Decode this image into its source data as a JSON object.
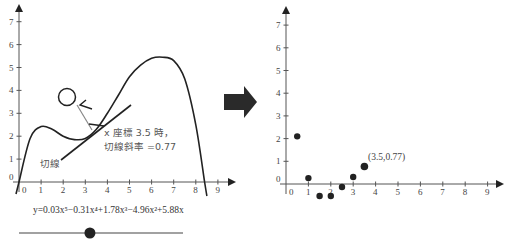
{
  "left_panel": {
    "x_ticks": [
      "0",
      "1",
      "2",
      "3",
      "4",
      "5",
      "6",
      "7",
      "8",
      "9"
    ],
    "y_ticks": [
      "0",
      "1",
      "2",
      "3",
      "4",
      "5",
      "6",
      "7"
    ],
    "annotation_line1": "x 座標 3.5 時，",
    "annotation_line2": "切線斜率 =0.77",
    "tangent_label": "切線",
    "equation": "y=0.03x⁵−0.31x⁴+1.78x³−4.96x²+5.88x",
    "slider": {
      "min": 0,
      "max": 7.4,
      "value": 3.2
    }
  },
  "arrow": {
    "icon": "right-arrow-icon",
    "color": "#2a2a2a"
  },
  "right_panel": {
    "x_ticks": [
      "0",
      "1",
      "2",
      "3",
      "4",
      "5",
      "6",
      "7",
      "8",
      "9"
    ],
    "y_ticks": [
      "0",
      "1",
      "2",
      "3",
      "4",
      "5",
      "6",
      "7"
    ],
    "highlight_label": "(3.5,0.77)"
  },
  "chart_data": [
    {
      "type": "line",
      "title": "",
      "xlabel": "",
      "ylabel": "",
      "xlim": [
        0,
        9
      ],
      "ylim": [
        0,
        7
      ],
      "series": [
        {
          "name": "y=0.03x^5-0.31x^4+1.78x^3-4.96x^2+5.88x",
          "x": [
            0,
            0.5,
            1,
            1.5,
            2,
            2.5,
            3,
            3.5,
            4,
            4.5,
            5,
            5.5,
            6,
            6.5,
            7,
            7.5,
            8,
            8.4
          ],
          "y": [
            0,
            1.9,
            2.42,
            2.3,
            2.0,
            1.85,
            1.9,
            2.3,
            3.0,
            3.8,
            4.6,
            5.1,
            5.4,
            5.45,
            5.3,
            4.5,
            2.5,
            0
          ]
        },
        {
          "name": "切線 (tangent at x=3.5)",
          "x": [
            1.9,
            5.1
          ],
          "y": [
            1.0,
            3.4
          ]
        }
      ],
      "annotations": [
        "x 座標 3.5 時，切線斜率 =0.77",
        "切線"
      ]
    },
    {
      "type": "scatter",
      "title": "",
      "xlabel": "",
      "ylabel": "",
      "xlim": [
        0,
        9
      ],
      "ylim": [
        0,
        7
      ],
      "series": [
        {
          "name": "slope",
          "x": [
            0.5,
            1,
            1.5,
            2,
            2.5,
            3,
            3.5
          ],
          "y": [
            2.1,
            0.26,
            -0.53,
            -0.53,
            -0.13,
            0.31,
            0.77
          ]
        }
      ],
      "annotations": [
        "(3.5,0.77)"
      ]
    }
  ]
}
